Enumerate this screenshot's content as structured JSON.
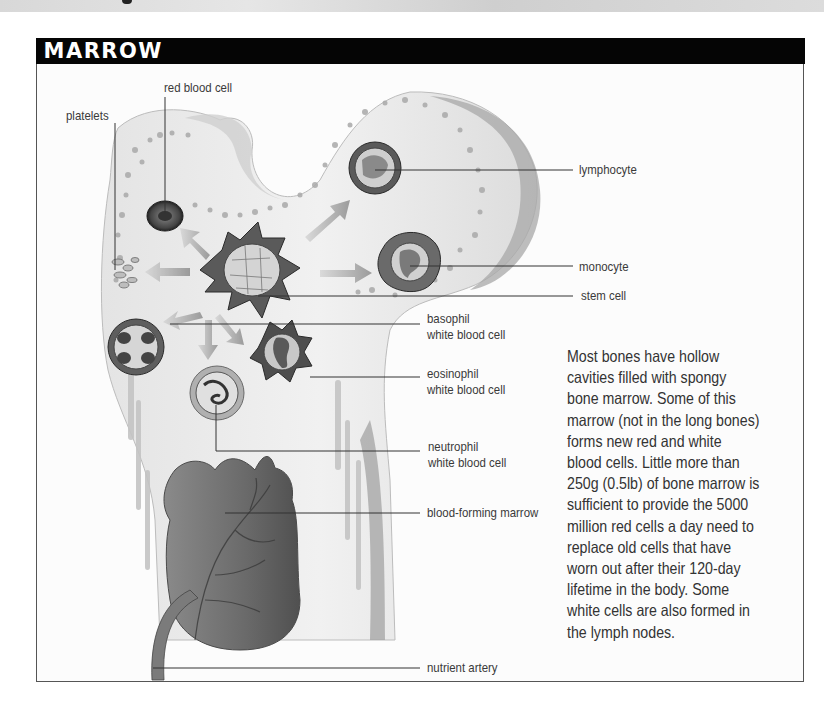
{
  "header": {
    "title": "MARROW"
  },
  "labels": {
    "red_blood_cell": "red blood cell",
    "platelets": "platelets",
    "lymphocyte": "lymphocyte",
    "monocyte": "monocyte",
    "stem_cell": "stem cell",
    "basophil": {
      "line1": "basophil",
      "line2": "white blood cell"
    },
    "eosinophil": {
      "line1": "eosinophil",
      "line2": "white blood cell"
    },
    "neutrophil": {
      "line1": "neutrophil",
      "line2": "white blood cell"
    },
    "blood_forming_marrow": "blood-forming marrow",
    "nutrient_artery": "nutrient artery"
  },
  "description": {
    "lines": [
      "Most bones have hollow",
      "cavities filled with spongy",
      "bone marrow. Some of this",
      "marrow (not in the long bones)",
      "forms new red and white",
      "blood cells. Little more than",
      "250g (0.5lb) of bone marrow is",
      "sufficient to provide the 5000",
      "million red cells a day need to",
      "replace old cells that have",
      "worn out after their 120-day",
      "lifetime in the body. Some",
      "white cells are also formed in",
      "the lymph nodes."
    ]
  },
  "colors": {
    "header_bg": "#050505",
    "header_text": "#ffffff",
    "border": "#555555",
    "text": "#333333",
    "bone": "#ececec",
    "marrow": "#6e6e6e"
  }
}
